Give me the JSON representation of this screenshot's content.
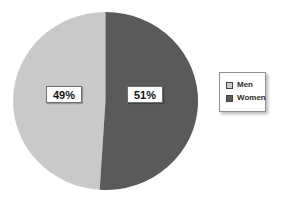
{
  "chart_data": {
    "type": "pie",
    "title": "",
    "slices": [
      {
        "label": "Men",
        "value": 49,
        "pct_label": "49%",
        "color": "#c9c9c9"
      },
      {
        "label": "Women",
        "value": 51,
        "pct_label": "51%",
        "color": "#5a5a5a"
      }
    ],
    "start_angle": "12-o-clock",
    "direction_first_slice": "counterclockwise-left",
    "legend_position": "right",
    "background": "#ffffff"
  }
}
